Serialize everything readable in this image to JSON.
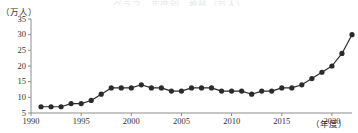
{
  "title_strip": "グラフ　年度別　推移（万人）",
  "axes": {
    "y_unit_label": "（万人）",
    "x_unit_label": "（年度）",
    "y_ticks": [
      "5",
      "10",
      "15",
      "20",
      "25",
      "30",
      "35"
    ],
    "x_ticks": [
      "1990",
      "1995",
      "2000",
      "2005",
      "2010",
      "2015",
      "2020"
    ]
  },
  "chart_data": {
    "type": "line",
    "title": "",
    "subtitle": "",
    "xlabel": "（年度）",
    "ylabel": "（万人）",
    "xlim": [
      1990,
      2022
    ],
    "ylim": [
      5,
      35
    ],
    "xticks": [
      1990,
      1995,
      2000,
      2005,
      2010,
      2015,
      2020
    ],
    "yticks": [
      5,
      10,
      15,
      20,
      25,
      30,
      35
    ],
    "grid": false,
    "legend": "none",
    "marker": "filled-circle",
    "line_color": "#2b2b2b",
    "marker_color": "#2b2b2b",
    "x": [
      1991,
      1992,
      1993,
      1994,
      1995,
      1996,
      1997,
      1998,
      1999,
      2000,
      2001,
      2002,
      2003,
      2004,
      2005,
      2006,
      2007,
      2008,
      2009,
      2010,
      2011,
      2012,
      2013,
      2014,
      2015,
      2016,
      2017,
      2018,
      2019,
      2020,
      2021,
      2022
    ],
    "values": [
      7,
      7,
      7,
      8,
      8,
      9,
      11,
      13,
      13,
      13,
      14,
      13,
      13,
      12,
      12,
      13,
      13,
      13,
      12,
      12,
      12,
      11,
      12,
      12,
      13,
      13,
      14,
      16,
      18,
      20,
      24,
      30
    ],
    "series": [
      {
        "name": "推移",
        "values": [
          7,
          7,
          7,
          8,
          8,
          9,
          11,
          13,
          13,
          13,
          14,
          13,
          13,
          12,
          12,
          13,
          13,
          13,
          12,
          12,
          12,
          11,
          12,
          12,
          13,
          13,
          14,
          16,
          18,
          20,
          24,
          30
        ]
      }
    ]
  }
}
